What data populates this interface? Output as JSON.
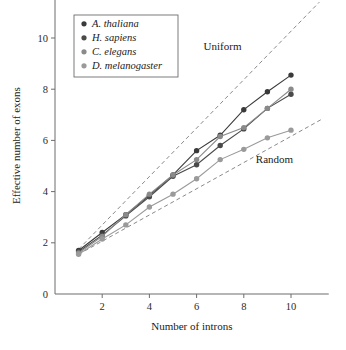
{
  "chart_data": {
    "type": "line",
    "title": "",
    "xlabel": "Number of introns",
    "ylabel": "Effective number of exons",
    "xlim": [
      0,
      11.6
    ],
    "ylim": [
      0,
      11.6
    ],
    "xticks": [
      2,
      4,
      6,
      8,
      10
    ],
    "yticks": [
      0,
      2,
      4,
      6,
      8,
      10
    ],
    "xtick_labels": [
      "2",
      "4",
      "6",
      "8",
      "10"
    ],
    "ytick_labels": [
      "0",
      "2",
      "4",
      "6",
      "8",
      "10"
    ],
    "grid": false,
    "legend_position": "top-left",
    "x": [
      1,
      2,
      3,
      4,
      5,
      6,
      7,
      8,
      9,
      10
    ],
    "series": [
      {
        "name": "A. thaliana",
        "color": "#3a3a3a",
        "marker": "circle",
        "values": [
          1.7,
          2.4,
          3.1,
          3.85,
          4.65,
          5.6,
          6.2,
          7.2,
          7.9,
          8.55
        ]
      },
      {
        "name": "H. sapiens",
        "color": "#4a4a4a",
        "marker": "circle",
        "values": [
          1.65,
          2.3,
          3.05,
          3.8,
          4.6,
          5.05,
          5.8,
          6.45,
          7.25,
          7.8
        ]
      },
      {
        "name": "C. elegans",
        "color": "#8a8a8a",
        "marker": "circle",
        "values": [
          1.6,
          2.25,
          3.1,
          3.9,
          4.65,
          5.25,
          6.15,
          6.5,
          7.25,
          8.0
        ]
      },
      {
        "name": "D. melanogaster",
        "color": "#9a9a9a",
        "marker": "circle",
        "values": [
          1.55,
          2.15,
          2.7,
          3.4,
          3.9,
          4.5,
          5.25,
          5.65,
          6.1,
          6.4
        ]
      }
    ],
    "reference_lines": [
      {
        "name": "Uniform",
        "label": "Uniform",
        "style": "dashed",
        "color": "#8a8a8a",
        "points": [
          [
            1,
            1.75
          ],
          [
            11.2,
            11.4
          ]
        ]
      },
      {
        "name": "Random",
        "label": "Random",
        "style": "dashed",
        "color": "#8a8a8a",
        "points": [
          [
            1,
            1.55
          ],
          [
            11.35,
            6.85
          ]
        ]
      }
    ],
    "annotations": [
      {
        "text": "Uniform",
        "x": 7.1,
        "y": 9.55
      },
      {
        "text": "Random",
        "x": 9.3,
        "y": 5.1
      }
    ]
  },
  "legend": {
    "entries": [
      {
        "label": "A. thaliana",
        "color": "#3a3a3a"
      },
      {
        "label": "H. sapiens",
        "color": "#4a4a4a"
      },
      {
        "label": "C. elegans",
        "color": "#8a8a8a"
      },
      {
        "label": "D. melanogaster",
        "color": "#9a9a9a"
      }
    ]
  },
  "axes": {
    "x_title": "Number of introns",
    "y_title": "Effective number of exons"
  }
}
